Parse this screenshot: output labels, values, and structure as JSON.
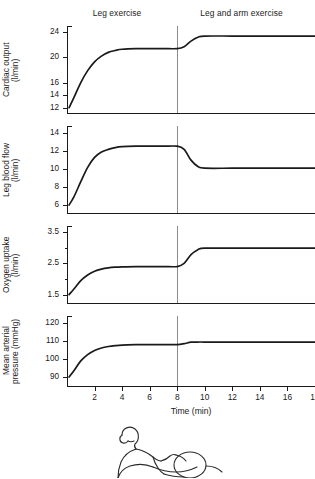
{
  "figure": {
    "phases": [
      {
        "label": "Leg exercise",
        "start_min": 0,
        "end_min": 8
      },
      {
        "label": "Leg and arm exercise",
        "start_min": 8,
        "end_min": 18
      }
    ],
    "divider_time_min": 8,
    "xaxis": {
      "title": "Time (min)",
      "min": 0,
      "max": 18,
      "ticks": [
        2,
        4,
        6,
        8,
        10,
        12,
        14,
        16,
        18
      ],
      "tick_labels": [
        "2",
        "4",
        "6",
        "8",
        "10",
        "12",
        "14",
        "16",
        "18"
      ]
    },
    "illustration": {
      "name": "person-exercising-line-drawing"
    }
  },
  "chart_data": [
    {
      "type": "line",
      "title": "Cardiac output",
      "ylabel": "Cardiac output\n(l/min)",
      "yunit": "l/min",
      "xlabel": "Time (min)",
      "ylim": [
        11,
        25
      ],
      "ytick_values": [
        24,
        20,
        16,
        14,
        12
      ],
      "ytick_labels": [
        "24",
        "20",
        "16",
        "14",
        "12"
      ],
      "xlim": [
        0,
        18
      ],
      "grid": false,
      "series": [
        {
          "name": "Cardiac output",
          "x": [
            0.15,
            0.5,
            1.0,
            1.5,
            2.0,
            2.5,
            3.0,
            3.5,
            4.0,
            5.0,
            6.0,
            7.0,
            8.0,
            8.5,
            9.0,
            9.5,
            10.0,
            12.0,
            14.0,
            16.0,
            18.0
          ],
          "values": [
            12.0,
            13.6,
            16.0,
            17.9,
            19.3,
            20.2,
            20.8,
            21.1,
            21.3,
            21.4,
            21.4,
            21.4,
            21.4,
            21.7,
            22.6,
            23.2,
            23.4,
            23.4,
            23.4,
            23.4,
            23.4
          ]
        }
      ]
    },
    {
      "type": "line",
      "title": "Leg blood flow",
      "ylabel": "Leg blood flow\n(l/min)",
      "yunit": "l/min",
      "xlabel": "Time (min)",
      "ylim": [
        5,
        14.8
      ],
      "ytick_values": [
        14,
        12,
        10,
        8,
        6
      ],
      "ytick_labels": [
        "14",
        "12",
        "10",
        "8",
        "6"
      ],
      "xlim": [
        0,
        18
      ],
      "grid": false,
      "series": [
        {
          "name": "Leg blood flow",
          "x": [
            0.15,
            0.5,
            1.0,
            1.5,
            2.0,
            2.5,
            3.0,
            3.5,
            4.0,
            5.0,
            6.0,
            7.0,
            8.0,
            8.5,
            9.0,
            9.5,
            10.0,
            12.0,
            14.0,
            16.0,
            18.0
          ],
          "values": [
            6.0,
            6.9,
            8.6,
            10.2,
            11.3,
            11.9,
            12.2,
            12.4,
            12.5,
            12.55,
            12.55,
            12.55,
            12.55,
            12.2,
            11.0,
            10.3,
            10.1,
            10.1,
            10.1,
            10.1,
            10.1
          ]
        }
      ]
    },
    {
      "type": "line",
      "title": "Oxygen uptake",
      "ylabel": "Oxygen uptake\n(l/min)",
      "yunit": "l/min",
      "xlabel": "Time (min)",
      "ylim": [
        1.2,
        3.7
      ],
      "ytick_values": [
        3.5,
        3.0,
        2.5,
        2.0,
        1.5
      ],
      "ytick_labels": [
        "3.5",
        "",
        "2.5",
        "",
        "1.5"
      ],
      "xlim": [
        0,
        18
      ],
      "grid": false,
      "series": [
        {
          "name": "Oxygen uptake",
          "x": [
            0.15,
            0.5,
            1.0,
            1.5,
            2.0,
            2.5,
            3.0,
            3.5,
            4.0,
            5.0,
            6.0,
            7.0,
            8.0,
            8.5,
            9.0,
            9.5,
            10.0,
            12.0,
            14.0,
            16.0,
            18.0
          ],
          "values": [
            1.5,
            1.68,
            1.95,
            2.13,
            2.25,
            2.32,
            2.36,
            2.38,
            2.39,
            2.4,
            2.4,
            2.4,
            2.4,
            2.5,
            2.78,
            2.94,
            2.99,
            2.99,
            2.99,
            2.99,
            2.99
          ]
        }
      ]
    },
    {
      "type": "line",
      "title": "Mean arterial pressure",
      "ylabel": "Mean arterial\npressure (mmHg)",
      "yunit": "mmHg",
      "xlabel": "Time (min)",
      "ylim": [
        85,
        124
      ],
      "ytick_values": [
        120,
        110,
        100,
        90
      ],
      "ytick_labels": [
        "120",
        "110",
        "100",
        "90"
      ],
      "xlim": [
        0,
        18
      ],
      "grid": false,
      "series": [
        {
          "name": "Mean arterial pressure",
          "x": [
            0.15,
            0.5,
            1.0,
            1.5,
            2.0,
            2.5,
            3.0,
            3.5,
            4.0,
            5.0,
            6.0,
            7.0,
            8.0,
            8.5,
            9.0,
            9.5,
            10.0,
            12.0,
            14.0,
            16.0,
            18.0
          ],
          "values": [
            90.0,
            93.5,
            99.0,
            102.5,
            104.8,
            106.2,
            107.0,
            107.5,
            107.8,
            108.0,
            108.1,
            108.1,
            108.1,
            108.6,
            109.4,
            109.5,
            109.5,
            109.5,
            109.5,
            109.5,
            109.5
          ]
        }
      ]
    }
  ]
}
